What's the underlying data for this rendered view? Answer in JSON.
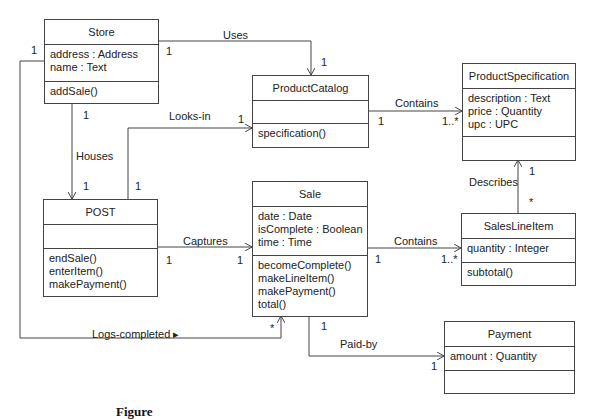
{
  "diagram": {
    "type": "UML class diagram",
    "classes": {
      "store": {
        "name": "Store",
        "attributes": [
          "address : Address",
          "name : Text"
        ],
        "operations": [
          "addSale()"
        ]
      },
      "product_catalog": {
        "name": "ProductCatalog",
        "attributes": [],
        "operations": [
          "specification()"
        ]
      },
      "product_specification": {
        "name": "ProductSpecification",
        "attributes": [
          "description : Text",
          "price : Quantity",
          "upc : UPC"
        ],
        "operations": []
      },
      "post": {
        "name": "POST",
        "attributes": [],
        "operations": [
          "endSale()",
          "enterItem()",
          "makePayment()"
        ]
      },
      "sale": {
        "name": "Sale",
        "attributes": [
          "date : Date",
          "isComplete : Boolean",
          "time : Time"
        ],
        "operations": [
          "becomeComplete()",
          "makeLineItem()",
          "makePayment()",
          "total()"
        ]
      },
      "sales_line_item": {
        "name": "SalesLineItem",
        "attributes": [
          "quantity : Integer"
        ],
        "operations": [
          "subtotal()"
        ]
      },
      "payment": {
        "name": "Payment",
        "attributes": [
          "amount : Quantity"
        ],
        "operations": []
      }
    },
    "associations": {
      "uses": {
        "label": "Uses",
        "from": "Store",
        "to": "ProductCatalog",
        "from_mult": "1",
        "to_mult": "1"
      },
      "contains_spec": {
        "label": "Contains",
        "from": "ProductCatalog",
        "to": "ProductSpecification",
        "from_mult": "1",
        "to_mult": "1..*"
      },
      "looks_in": {
        "label": "Looks-in",
        "from": "POST",
        "to": "ProductCatalog",
        "from_mult": "1",
        "to_mult": "1"
      },
      "houses": {
        "label": "Houses",
        "from": "Store",
        "to": "POST",
        "from_mult": "1",
        "to_mult": "1"
      },
      "captures": {
        "label": "Captures",
        "from": "POST",
        "to": "Sale",
        "from_mult": "1",
        "to_mult": "1"
      },
      "contains_items": {
        "label": "Contains",
        "from": "Sale",
        "to": "SalesLineItem",
        "from_mult": "1",
        "to_mult": "1..*"
      },
      "describes": {
        "label": "Describes",
        "from": "SalesLineItem",
        "to": "ProductSpecification",
        "from_mult": "*",
        "to_mult": "1"
      },
      "logs_completed": {
        "label": "Logs-completed ▸",
        "from": "Store",
        "to": "Sale",
        "from_mult": "1",
        "to_mult": "*"
      },
      "paid_by": {
        "label": "Paid-by",
        "from": "Sale",
        "to": "Payment",
        "from_mult": "1",
        "to_mult": "1"
      }
    },
    "caption": "Figure"
  }
}
